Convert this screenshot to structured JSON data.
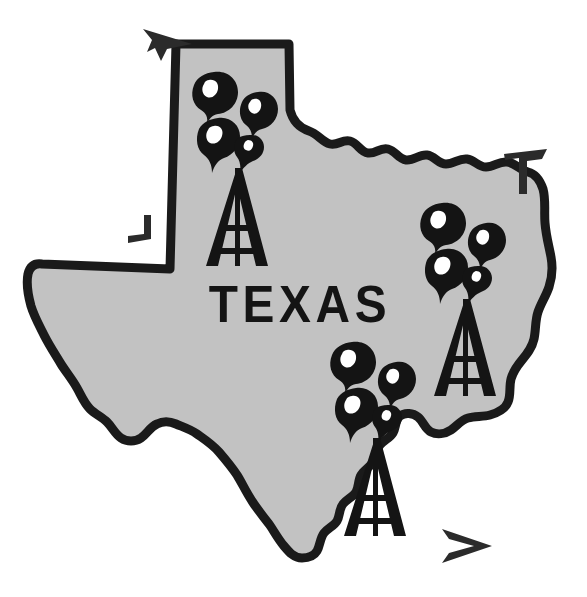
{
  "illustration": {
    "title": "Texas Oil Derricks Map",
    "subject": "Texas",
    "state_label": "TEXAS",
    "style": "vintage line-art clip art, gray fill with heavy black outline"
  },
  "colors": {
    "background": "#ffffff",
    "state_fill": "#c2c2c2",
    "outline": "#1a1a1a",
    "ink": "#141414",
    "highlight": "#ffffff",
    "crop_mark": "#2b2b2b"
  },
  "derricks": [
    {
      "name": "panhandle-derrick",
      "region_label": "Panhandle",
      "apex_x": 237,
      "apex_y": 168,
      "base_y": 266,
      "half_width": 31,
      "gusher_droplets": 4
    },
    {
      "name": "east-derrick",
      "region_label": "East Texas",
      "apex_x": 465,
      "apex_y": 299,
      "base_y": 396,
      "half_width": 31,
      "gusher_droplets": 4
    },
    {
      "name": "south-derrick",
      "region_label": "South Texas",
      "apex_x": 375,
      "apex_y": 438,
      "base_y": 536,
      "half_width": 31,
      "gusher_droplets": 4
    }
  ],
  "crop_marks": [
    {
      "name": "crop-mark-top-left",
      "glyph": "arrowhead",
      "direction": "up-left",
      "x": 160,
      "y": 40
    },
    {
      "name": "crop-mark-top-right",
      "glyph": "corner-bracket",
      "direction": "top-right",
      "x": 525,
      "y": 160
    },
    {
      "name": "crop-mark-mid-left",
      "glyph": "corner-bracket",
      "direction": "bottom-left",
      "x": 142,
      "y": 236
    },
    {
      "name": "crop-mark-bottom-right",
      "glyph": "arrowhead",
      "direction": "right",
      "x": 468,
      "y": 546
    }
  ],
  "label_position": {
    "center_x": 300,
    "baseline_y": 322
  }
}
